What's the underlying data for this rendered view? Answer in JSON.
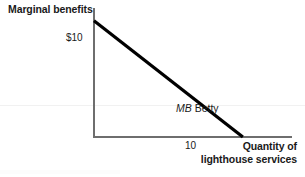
{
  "chart_data": {
    "type": "line",
    "title": "",
    "xlabel": "Quantity of lighthouse services",
    "xlabel_line1": "Quantity of",
    "xlabel_line2": "lighthouse services",
    "ylabel": "Marginal benefits",
    "series": [
      {
        "name": "MB Betty",
        "label": "MB Betty",
        "label_italic_part": "MB",
        "label_plain_part": " Betty",
        "x": [
          0,
          10
        ],
        "y": [
          10,
          0
        ],
        "color": "#000000"
      }
    ],
    "x_ticks": [
      "10"
    ],
    "x_tick_values": [
      10
    ],
    "y_ticks": [
      "$10"
    ],
    "y_tick_values": [
      10
    ],
    "xlim": [
      0,
      13.3
    ],
    "ylim": [
      0,
      11.1
    ],
    "grid": false,
    "legend": "none",
    "axis_color": "#6e6e6e",
    "text_color": "#1a1a1a"
  },
  "figure": {
    "y_axis_label": "Marginal benefits",
    "y_tick_10": "$10",
    "x_tick_10": "10",
    "x_axis_label_line1": "Quantity of",
    "x_axis_label_line2": "lighthouse services",
    "curve_label_italic": "MB",
    "curve_label_plain": " Betty"
  }
}
